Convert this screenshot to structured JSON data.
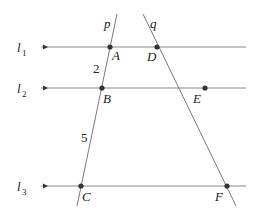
{
  "diagram": {
    "parallel_lines": [
      {
        "name": "l",
        "sub": "1",
        "y": 47
      },
      {
        "name": "l",
        "sub": "2",
        "y": 88
      },
      {
        "name": "l",
        "sub": "3",
        "y": 186
      }
    ],
    "transversals": [
      {
        "name": "p",
        "from": [
          117,
          14
        ],
        "to": [
          77,
          206
        ]
      },
      {
        "name": "q",
        "from": [
          143,
          14
        ],
        "to": [
          236,
          206
        ]
      }
    ],
    "points": [
      {
        "name": "A",
        "x": 110,
        "y": 47
      },
      {
        "name": "B",
        "x": 102,
        "y": 88
      },
      {
        "name": "C",
        "x": 81,
        "y": 186
      },
      {
        "name": "D",
        "x": 157,
        "y": 47
      },
      {
        "name": "E",
        "x": 205,
        "y": 88
      },
      {
        "name": "F",
        "x": 227,
        "y": 186
      }
    ],
    "segment_labels": [
      {
        "text": "2",
        "segment": "AB"
      },
      {
        "text": "5",
        "segment": "BC"
      }
    ],
    "line_color": "#7a7a7a",
    "point_color": "#333333"
  },
  "labels": {
    "l1": "l",
    "l1_sub": "1",
    "l2": "l",
    "l2_sub": "2",
    "l3": "l",
    "l3_sub": "3",
    "p": "p",
    "q": "q",
    "A": "A",
    "B": "B",
    "C": "C",
    "D": "D",
    "E": "E",
    "F": "F",
    "ab_length": "2",
    "bc_length": "5"
  }
}
